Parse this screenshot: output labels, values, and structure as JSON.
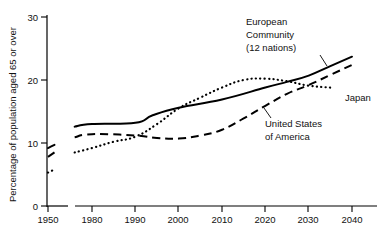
{
  "chart_data": {
    "type": "line",
    "title": "",
    "xlabel": "",
    "ylabel": "Percentage of population aged 65 or over",
    "xlim": [
      1950,
      2040
    ],
    "ylim": [
      0,
      30
    ],
    "grid": false,
    "legend_position": "inline-annotations",
    "axis_break": true,
    "axis_break_note": "x-axis broken between 1950 and 1980",
    "x_ticks": [
      "1950",
      "1980",
      "1990",
      "2000",
      "2010",
      "2020",
      "2030",
      "2040"
    ],
    "y_ticks": [
      "0",
      "10",
      "20",
      "30"
    ],
    "series": [
      {
        "name": "European Community (12 nations)",
        "style": "solid",
        "stub_x": [
          1950,
          1955
        ],
        "stub_values": [
          9.2,
          9.7
        ],
        "x": [
          1976,
          1980,
          1990,
          1994,
          2000,
          2010,
          2020,
          2025,
          2030,
          2035,
          2040
        ],
        "values": [
          12.6,
          13.0,
          13.2,
          14.4,
          15.6,
          16.9,
          18.8,
          19.7,
          20.7,
          22.2,
          23.7
        ]
      },
      {
        "name": "United States of America",
        "style": "dashed",
        "stub_x": [
          1950,
          1955
        ],
        "stub_values": [
          7.8,
          8.5
        ],
        "x": [
          1976,
          1980,
          1990,
          1995,
          2000,
          2005,
          2010,
          2015,
          2020,
          2025,
          2030,
          2035,
          2040
        ],
        "values": [
          10.9,
          11.4,
          11.2,
          10.8,
          10.7,
          11.2,
          12.1,
          13.9,
          15.9,
          17.8,
          19.2,
          20.8,
          22.4
        ]
      },
      {
        "name": "Japan",
        "style": "dotted",
        "stub_x": [
          1950,
          1956
        ],
        "stub_values": [
          5.3,
          5.9
        ],
        "x": [
          1976,
          1980,
          1985,
          1990,
          1995,
          2000,
          2005,
          2010,
          2015,
          2020,
          2025,
          2030,
          2035
        ],
        "values": [
          8.5,
          9.2,
          10.2,
          11.0,
          13.0,
          15.5,
          17.2,
          18.8,
          20.0,
          20.2,
          19.8,
          19.1,
          18.8
        ]
      }
    ],
    "annotations": [
      {
        "id": "ec",
        "label_lines": [
          "European",
          "Community",
          "(12 nations)"
        ],
        "target_series": "European Community (12 nations)"
      },
      {
        "id": "japan",
        "label_lines": [
          "Japan"
        ],
        "target_series": "Japan"
      },
      {
        "id": "usa",
        "label_lines": [
          "United States",
          "of America"
        ],
        "target_series": "United States of America"
      }
    ],
    "colors": {
      "line": "#000000",
      "axis": "#000000",
      "background": "#ffffff"
    }
  }
}
